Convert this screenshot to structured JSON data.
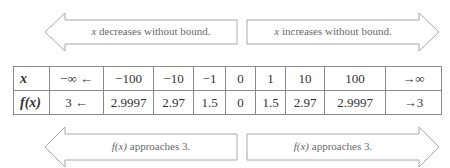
{
  "arrows": {
    "top_left": {
      "direction": "left",
      "var": "x",
      "text": " decreases without bound."
    },
    "top_right": {
      "direction": "right",
      "var": "x",
      "text": " increases without bound."
    },
    "bottom_left": {
      "direction": "left",
      "var": "f(x)",
      "text": " approaches 3."
    },
    "bottom_right": {
      "direction": "right",
      "var": "f(x)",
      "text": " approaches 3."
    }
  },
  "table": {
    "row_headers": [
      "x",
      "f(x)"
    ],
    "x_values": [
      "−∞ ←",
      "−100",
      "−10",
      "−1",
      "0",
      "1",
      "10",
      "100",
      "→∞"
    ],
    "fx_values": [
      "3 ←",
      "2.9997",
      "2.97",
      "1.5",
      "0",
      "1.5",
      "2.97",
      "2.9997",
      "→3"
    ]
  },
  "colors": {
    "arrow_stroke": "#a8a8a8",
    "grid": "#8a8a8a",
    "label_text": "#6a6a6a"
  }
}
